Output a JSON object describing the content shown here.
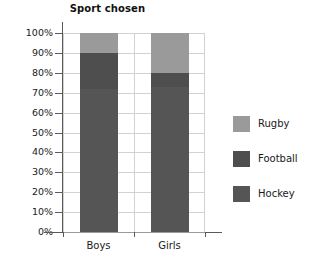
{
  "chart_data": {
    "type": "bar",
    "subtype": "stacked-percentage",
    "title": "Sport chosen",
    "xlabel": "",
    "ylabel": "",
    "categories": [
      "Boys",
      "Girls"
    ],
    "series": [
      {
        "name": "Hockey",
        "values": [
          72,
          73
        ],
        "color": "#555555"
      },
      {
        "name": "Football",
        "values": [
          18,
          7
        ],
        "color": "#4e4e4e"
      },
      {
        "name": "Rugby",
        "values": [
          10,
          20
        ],
        "color": "#9a9a9a"
      }
    ],
    "stack_order_bottom_to_top": [
      "Hockey",
      "Football",
      "Rugby"
    ],
    "cumulative_tops": {
      "Boys": {
        "Hockey": 72,
        "Football": 90,
        "Rugby": 100
      },
      "Girls": {
        "Hockey": 73,
        "Football": 80,
        "Rugby": 100
      }
    },
    "ylim": [
      0,
      100
    ],
    "ytick_values": [
      0,
      10,
      20,
      30,
      40,
      50,
      60,
      70,
      80,
      90,
      100
    ],
    "ytick_labels": [
      "0%",
      "10%",
      "20%",
      "30%",
      "40%",
      "50%",
      "60%",
      "70%",
      "80%",
      "90%",
      "100%"
    ],
    "grid": true,
    "grid_axis": "y",
    "legend_position": "right",
    "legend_entries": [
      "Rugby",
      "Football",
      "Hockey"
    ]
  },
  "legend": {
    "items": [
      {
        "label": "Rugby",
        "color": "#9a9a9a"
      },
      {
        "label": "Football",
        "color": "#4e4e4e"
      },
      {
        "label": "Hockey",
        "color": "#555555"
      }
    ]
  },
  "colors": {
    "rugby": "#9a9a9a",
    "football": "#4e4e4e",
    "hockey": "#555555",
    "grid": "#d2d2d2",
    "axis": "#5a5a5a",
    "background": "#ffffff",
    "text": "#1a1a1a"
  }
}
